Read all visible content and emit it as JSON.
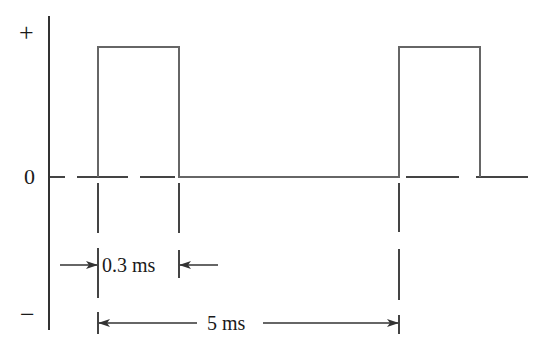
{
  "diagram": {
    "title": "",
    "type": "pulse waveform",
    "axis_labels": {
      "positive": "+",
      "zero": "0",
      "negative": "−"
    },
    "pulse_width_label": "0.3 ms",
    "period_label": "5 ms",
    "colors": {
      "line": "#666666",
      "axis": "#333333",
      "text": "#1a1a1a",
      "background": "#ffffff"
    },
    "pulses": [
      {
        "start_px": 98,
        "end_px": 179
      },
      {
        "start_px": 399,
        "end_px": 480
      }
    ],
    "pulse_width_ms": 0.3,
    "period_ms": 5
  }
}
